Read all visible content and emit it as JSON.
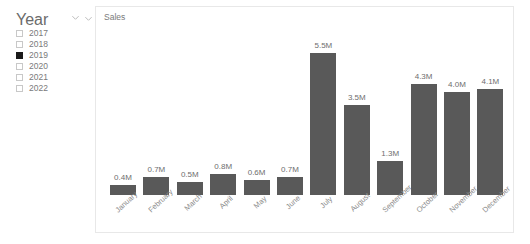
{
  "slicer": {
    "title": "Year",
    "collapse_icon": "chevron-down-icon",
    "items": [
      {
        "label": "2017",
        "checked": false
      },
      {
        "label": "2018",
        "checked": false
      },
      {
        "label": "2019",
        "checked": true
      },
      {
        "label": "2020",
        "checked": false
      },
      {
        "label": "2021",
        "checked": false
      },
      {
        "label": "2022",
        "checked": false
      }
    ]
  },
  "chart_panel": {
    "collapse_icon": "chevron-down-icon",
    "title": "Sales"
  },
  "colors": {
    "bar_fill": "#595959",
    "label_text": "#6e6e6e",
    "category_text": "#8a8a8a",
    "panel_border": "#e8e8e8",
    "checkbox_checked": "#1a1a1a"
  },
  "chart_data": {
    "type": "bar",
    "title": "Sales",
    "xlabel": "",
    "ylabel": "",
    "grid": false,
    "legend": "none",
    "axis_labels_rotated_deg": -43,
    "value_unit": "M",
    "ylim": [
      0,
      5.5
    ],
    "categories": [
      "January",
      "February",
      "March",
      "April",
      "May",
      "June",
      "July",
      "August",
      "September",
      "October",
      "November",
      "December"
    ],
    "values": [
      0.4,
      0.7,
      0.5,
      0.8,
      0.6,
      0.7,
      5.5,
      3.5,
      1.3,
      4.3,
      4.0,
      4.1
    ],
    "data_labels": [
      "0.4M",
      "0.7M",
      "0.5M",
      "0.8M",
      "0.6M",
      "0.7M",
      "5.5M",
      "3.5M",
      "1.3M",
      "4.3M",
      "4.0M",
      "4.1M"
    ]
  }
}
